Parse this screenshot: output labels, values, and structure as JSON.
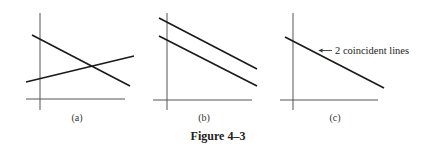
{
  "figure": {
    "caption": "Figure 4–3",
    "panels": [
      {
        "id": "a",
        "label": "(a)",
        "description": "two intersecting lines",
        "lines": [
          {
            "name": "decreasing line",
            "x1": 32,
            "y1": 35,
            "x2": 130,
            "y2": 86
          },
          {
            "name": "increasing line",
            "x1": 26,
            "y1": 82,
            "x2": 134,
            "y2": 56
          }
        ]
      },
      {
        "id": "b",
        "label": "(b)",
        "description": "two parallel lines",
        "lines": [
          {
            "name": "upper parallel line",
            "x1": 159,
            "y1": 18,
            "x2": 257,
            "y2": 69
          },
          {
            "name": "lower parallel line",
            "x1": 159,
            "y1": 36,
            "x2": 257,
            "y2": 86
          }
        ]
      },
      {
        "id": "c",
        "label": "(c)",
        "description": "two coincident lines",
        "annotation": "2 coincident lines",
        "lines": [
          {
            "name": "coincident line",
            "x1": 285,
            "y1": 37,
            "x2": 384,
            "y2": 88
          }
        ]
      }
    ]
  }
}
